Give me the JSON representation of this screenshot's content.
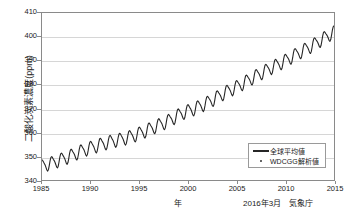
{
  "chart_data": {
    "type": "line",
    "title": "",
    "xlabel": "年",
    "ylabel": "二酸化炭素濃度(ppm)",
    "xlim": [
      1985,
      2015
    ],
    "ylim": [
      340,
      410
    ],
    "grid": true,
    "xticks": [
      "1985",
      "1990",
      "1995",
      "2000",
      "2005",
      "2010",
      "2015"
    ],
    "yticks": [
      "340",
      "350",
      "360",
      "370",
      "380",
      "390",
      "400",
      "410"
    ],
    "legend_position": "lower-right",
    "series": [
      {
        "name": "全球平均値",
        "style": "line",
        "color": "#262626",
        "description": "Monthly global mean CO2 concentration with seasonal cycle, rising from about 346 ppm in 1985 to about 400 ppm in 2015",
        "x": [
          1985.0,
          1985.5,
          1986.0,
          1986.5,
          1987.0,
          1987.5,
          1988.0,
          1988.5,
          1989.0,
          1989.5,
          1990.0,
          1990.5,
          1991.0,
          1991.5,
          1992.0,
          1992.5,
          1993.0,
          1993.5,
          1994.0,
          1994.5,
          1995.0,
          1995.5,
          1996.0,
          1996.5,
          1997.0,
          1997.5,
          1998.0,
          1998.5,
          1999.0,
          1999.5,
          2000.0,
          2000.5,
          2001.0,
          2001.5,
          2002.0,
          2002.5,
          2003.0,
          2003.5,
          2004.0,
          2004.5,
          2005.0,
          2005.5,
          2006.0,
          2006.5,
          2007.0,
          2007.5,
          2008.0,
          2008.5,
          2009.0,
          2009.5,
          2010.0,
          2010.5,
          2011.0,
          2011.5,
          2012.0,
          2012.5,
          2013.0,
          2013.5,
          2014.0,
          2014.5,
          2015.0
        ],
        "y_trend": [
          345.9,
          346.6,
          347.2,
          347.9,
          348.7,
          349.4,
          350.3,
          351.2,
          352.1,
          352.9,
          353.6,
          354.2,
          354.9,
          355.5,
          356.1,
          356.6,
          357.0,
          357.5,
          358.1,
          358.8,
          359.6,
          360.4,
          361.3,
          362.2,
          363.1,
          363.9,
          364.9,
          366.0,
          367.2,
          368.2,
          369.0,
          369.7,
          370.6,
          371.5,
          372.5,
          373.6,
          374.8,
          376.0,
          377.1,
          378.1,
          379.1,
          380.2,
          381.4,
          382.6,
          383.7,
          384.8,
          385.9,
          387.0,
          388.0,
          389.0,
          390.1,
          391.3,
          392.5,
          393.6,
          394.7,
          395.8,
          397.0,
          398.3,
          399.6,
          400.9,
          402.0
        ],
        "seasonal_amplitude_ppm": 2.6,
        "endpoints": {
          "start_year": 1985,
          "start_value": 346.5,
          "end_year": 2015,
          "end_value": 400.0
        }
      },
      {
        "name": "WDCGG解析値",
        "style": "marker",
        "marker": "dot",
        "color": "#3a3a3a"
      }
    ]
  },
  "legend": {
    "items": [
      {
        "label": "全球平均値",
        "key": "line"
      },
      {
        "label": "WDCGG解析値",
        "key": "dot"
      }
    ]
  },
  "credit": {
    "text": "2016年3月　気象庁"
  }
}
